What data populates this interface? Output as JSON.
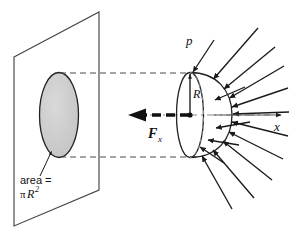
{
  "figure": {
    "background_color": "#ffffff",
    "line_color": "#1a1a1a",
    "disk_fill_color": "#cccccc",
    "dashed_color": "#555555",
    "labels": {
      "area_line1": "area =",
      "area_pi": "π",
      "area_R": "R",
      "area_exponent": "2",
      "pressure": "p",
      "radius": "R",
      "force": "F",
      "force_subscript": "x",
      "axis": "x"
    },
    "geometry": {
      "plane_corners": "14,57 99,12 99,190 14,226",
      "projected_ellipse": {
        "cx": 59,
        "cy": 115,
        "rx": 19,
        "ry": 42
      },
      "disk_ellipse": {
        "cx": 190,
        "cy": 115,
        "rx": 13,
        "ry": 42
      },
      "hemisphere_radius": 42,
      "axis_y": 115,
      "guide_top_y": 73,
      "guide_bottom_y": 157,
      "arrow_count": 14
    }
  }
}
